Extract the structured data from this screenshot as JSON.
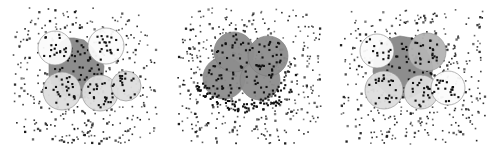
{
  "figure": {
    "type": "scatter-cluster-panels",
    "panel_count": 3,
    "background_color": "#ffffff",
    "noise_point_color": "#1a1a1a",
    "cluster_point_color": "#111111",
    "blob_fill_color": "#8d8d8d",
    "blob_stroke_color": "#7a7a7a",
    "circle_light_fill": "#dedede",
    "circle_white_fill": "#fbfbfb",
    "circle_mid_fill": "#b4b4b4",
    "circle_stroke_color": "#8f8f8f",
    "point_size_px": 1.6,
    "cluster_point_size_px": 2.1
  },
  "chart_data": {
    "type": "scatter",
    "title": "",
    "subtitle": "",
    "xlabel": "",
    "ylabel": "",
    "grid": false,
    "legend": false,
    "axes_visible": false,
    "xlim": [
      0,
      100
    ],
    "ylim": [
      0,
      100
    ],
    "panels": [
      {
        "name": "panel-left",
        "label": "",
        "index": 1,
        "field": {
          "x": 13,
          "y": 8,
          "width": 144,
          "height": 136
        },
        "noise_points": 430,
        "noise_seed": 1471,
        "blob": {
          "description": "irregular dark-gray core region under the circles",
          "fill": "#8d8d8d",
          "opacity": 1,
          "polygon": [
            [
              74,
              38
            ],
            [
              84,
              40
            ],
            [
              92,
              47
            ],
            [
              99,
              56
            ],
            [
              104,
              66
            ],
            [
              103,
              79
            ],
            [
              96,
              90
            ],
            [
              86,
              97
            ],
            [
              74,
              99
            ],
            [
              62,
              95
            ],
            [
              54,
              87
            ],
            [
              49,
              76
            ],
            [
              49,
              64
            ],
            [
              53,
              52
            ],
            [
              60,
              43
            ],
            [
              67,
              38
            ]
          ]
        },
        "circles": [
          {
            "id": "c1",
            "cx": 55,
            "cy": 48,
            "r": 17,
            "fill": "#fbfbfb",
            "stroke": "#8f8f8f",
            "points": 18,
            "seed": 11
          },
          {
            "id": "c2",
            "cx": 106,
            "cy": 46,
            "r": 18,
            "fill": "#fbfbfb",
            "stroke": "#8f8f8f",
            "points": 19,
            "seed": 22
          },
          {
            "id": "c3",
            "cx": 62,
            "cy": 91,
            "r": 19,
            "fill": "#dedede",
            "stroke": "#8f8f8f",
            "points": 24,
            "seed": 33
          },
          {
            "id": "c4",
            "cx": 100,
            "cy": 93,
            "r": 18,
            "fill": "#dedede",
            "stroke": "#8f8f8f",
            "points": 23,
            "seed": 44
          },
          {
            "id": "c5",
            "cx": 126,
            "cy": 86,
            "r": 15,
            "fill": "#dedede",
            "stroke": "#8f8f8f",
            "points": 15,
            "seed": 55
          }
        ],
        "core_points": 72,
        "core_seed": 901
      },
      {
        "name": "panel-middle",
        "label": "",
        "index": 2,
        "field": {
          "x": 13,
          "y": 8,
          "width": 144,
          "height": 136
        },
        "noise_points": 470,
        "noise_seed": 2733,
        "blob": null,
        "circles": [
          {
            "id": "d1",
            "cx": 60,
            "cy": 78,
            "r": 21,
            "fill": "#8d8d8d",
            "stroke": "#7c7c7c",
            "points": 26,
            "seed": 66
          },
          {
            "id": "d2",
            "cx": 70,
            "cy": 52,
            "r": 20,
            "fill": "#8d8d8d",
            "stroke": "#7c7c7c",
            "points": 24,
            "seed": 77
          },
          {
            "id": "d3",
            "cx": 96,
            "cy": 80,
            "r": 20,
            "fill": "#8d8d8d",
            "stroke": "#7c7c7c",
            "points": 22,
            "seed": 88
          },
          {
            "id": "d4",
            "cx": 104,
            "cy": 56,
            "r": 20,
            "fill": "#8d8d8d",
            "stroke": "#7c7c7c",
            "points": 25,
            "seed": 99
          }
        ],
        "arc_points": 88,
        "arc_seed": 1212,
        "core_points": 0,
        "core_seed": 0
      },
      {
        "name": "panel-right",
        "label": "",
        "index": 3,
        "field": {
          "x": 13,
          "y": 8,
          "width": 144,
          "height": 136
        },
        "noise_points": 455,
        "noise_seed": 3917,
        "blob": {
          "description": "irregular dark-gray core region under the circles",
          "fill": "#8d8d8d",
          "opacity": 1,
          "polygon": [
            [
              72,
              36
            ],
            [
              84,
              38
            ],
            [
              94,
              45
            ],
            [
              101,
              55
            ],
            [
              105,
              67
            ],
            [
              103,
              80
            ],
            [
              95,
              91
            ],
            [
              83,
              98
            ],
            [
              70,
              98
            ],
            [
              58,
              93
            ],
            [
              49,
              84
            ],
            [
              45,
              72
            ],
            [
              46,
              59
            ],
            [
              52,
              47
            ],
            [
              61,
              39
            ]
          ]
        },
        "circles": [
          {
            "id": "e1",
            "cx": 49,
            "cy": 51,
            "r": 17,
            "fill": "#fbfbfb",
            "stroke": "#8f8f8f",
            "points": 14,
            "seed": 101
          },
          {
            "id": "e2",
            "cx": 99,
            "cy": 52,
            "r": 19,
            "fill": "#b4b4b4",
            "stroke": "#8f8f8f",
            "points": 22,
            "seed": 202
          },
          {
            "id": "e3",
            "cx": 56,
            "cy": 90,
            "r": 19,
            "fill": "#dedede",
            "stroke": "#8f8f8f",
            "points": 22,
            "seed": 303
          },
          {
            "id": "e4",
            "cx": 93,
            "cy": 92,
            "r": 17,
            "fill": "#dedede",
            "stroke": "#8f8f8f",
            "points": 20,
            "seed": 404
          },
          {
            "id": "e5",
            "cx": 120,
            "cy": 88,
            "r": 17,
            "fill": "#fbfbfb",
            "stroke": "#8f8f8f",
            "points": 19,
            "seed": 505
          }
        ],
        "core_points": 66,
        "core_seed": 1606
      }
    ]
  }
}
